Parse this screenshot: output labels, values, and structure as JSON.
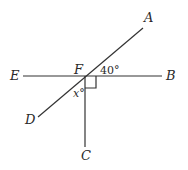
{
  "diagram": {
    "type": "geometry",
    "points": {
      "A": {
        "label": "A",
        "x": 143,
        "y": 28
      },
      "B": {
        "label": "B",
        "x": 162,
        "y": 76
      },
      "C": {
        "label": "C",
        "x": 85,
        "y": 147
      },
      "D": {
        "label": "D",
        "x": 38,
        "y": 117
      },
      "E": {
        "label": "E",
        "x": 23,
        "y": 76
      },
      "F": {
        "label": "F",
        "x": 85,
        "y": 76
      }
    },
    "segments": [
      "EB",
      "DA",
      "FC"
    ],
    "angles": {
      "angle_AFB": {
        "label": "40°",
        "value": 40
      },
      "angle_DFC": {
        "label": "x°",
        "value": "x"
      },
      "angle_BFC": {
        "label": "right-angle",
        "value": 90
      }
    }
  }
}
